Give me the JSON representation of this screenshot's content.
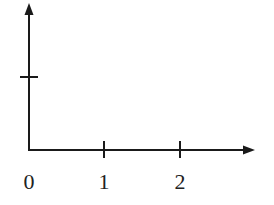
{
  "diagram": {
    "type": "coordinate-axes",
    "origin": {
      "x": 29,
      "y": 150
    },
    "x_axis": {
      "end_x": 254,
      "arrow": true,
      "ticks": [
        {
          "value": "1",
          "x": 104
        },
        {
          "value": "2",
          "x": 180
        }
      ],
      "origin_label": "0"
    },
    "y_axis": {
      "end_y": 4,
      "arrow": true,
      "ticks": [
        {
          "y": 77
        }
      ]
    },
    "labels": {
      "origin": "0",
      "x1": "1",
      "x2": "2"
    },
    "colors": {
      "stroke": "#1a1a1a",
      "text": "#222222",
      "background": "#ffffff"
    }
  }
}
